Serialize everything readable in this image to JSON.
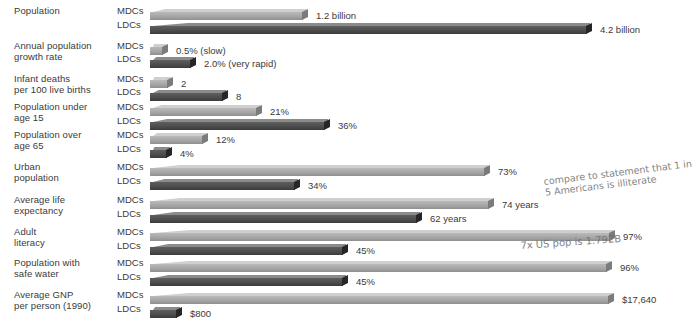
{
  "chart_data": {
    "type": "bar",
    "title": "",
    "xlabel": "",
    "ylabel": "",
    "orientation": "horizontal",
    "grid": false,
    "legend_position": "inline-row-labels",
    "series": [
      {
        "name": "MDCs",
        "style": "light"
      },
      {
        "name": "LDCs",
        "style": "dark"
      }
    ],
    "categories": [
      "Population",
      "Annual population growth rate",
      "Infant deaths per 100 live births",
      "Population under age 15",
      "Population over age 65",
      "Urban population",
      "Average life expectancy",
      "Adult literacy",
      "Population with safe water",
      "Average GNP per person (1990)"
    ],
    "rows": [
      {
        "label_line1": "Population",
        "label_line2": "",
        "mdc": {
          "group": "MDCs",
          "value": 1.2,
          "unit": "billion",
          "value_label": "1.2 billion",
          "bar_end_px": 308
        },
        "ldc": {
          "group": "LDCs",
          "value": 4.2,
          "unit": "billion",
          "value_label": "4.2 billion",
          "bar_end_px": 592
        }
      },
      {
        "label_line1": "Annual population",
        "label_line2": "growth rate",
        "mdc": {
          "group": "MDCs",
          "value": 0.5,
          "unit": "%",
          "value_label": "0.5% (slow)",
          "bar_end_px": 168
        },
        "ldc": {
          "group": "LDCs",
          "value": 2.0,
          "unit": "%",
          "value_label": "2.0% (very rapid)",
          "bar_end_px": 196
        }
      },
      {
        "label_line1": "Infant deaths",
        "label_line2": "per 100 live births",
        "mdc": {
          "group": "MDCs",
          "value": 2,
          "unit": "",
          "value_label": "2",
          "bar_end_px": 173
        },
        "ldc": {
          "group": "LDCs",
          "value": 8,
          "unit": "",
          "value_label": "8",
          "bar_end_px": 228
        }
      },
      {
        "label_line1": "Population under",
        "label_line2": "age 15",
        "mdc": {
          "group": "MDCs",
          "value": 21,
          "unit": "%",
          "value_label": "21%",
          "bar_end_px": 262
        },
        "ldc": {
          "group": "LDCs",
          "value": 36,
          "unit": "%",
          "value_label": "36%",
          "bar_end_px": 330
        }
      },
      {
        "label_line1": "Population over",
        "label_line2": "age 65",
        "mdc": {
          "group": "MDCs",
          "value": 12,
          "unit": "%",
          "value_label": "12%",
          "bar_end_px": 208
        },
        "ldc": {
          "group": "LDCs",
          "value": 4,
          "unit": "%",
          "value_label": "4%",
          "bar_end_px": 172
        }
      },
      {
        "label_line1": "Urban",
        "label_line2": "population",
        "mdc": {
          "group": "MDCs",
          "value": 73,
          "unit": "%",
          "value_label": "73%",
          "bar_end_px": 490
        },
        "ldc": {
          "group": "LDCs",
          "value": 34,
          "unit": "%",
          "value_label": "34%",
          "bar_end_px": 300
        }
      },
      {
        "label_line1": "Average life",
        "label_line2": "expectancy",
        "mdc": {
          "group": "MDCs",
          "value": 74,
          "unit": "years",
          "value_label": "74 years",
          "bar_end_px": 494
        },
        "ldc": {
          "group": "LDCs",
          "value": 62,
          "unit": "years",
          "value_label": "62 years",
          "bar_end_px": 422
        }
      },
      {
        "label_line1": "Adult",
        "label_line2": "literacy",
        "mdc": {
          "group": "MDCs",
          "value": 97,
          "unit": "%",
          "value_label": "97%",
          "bar_end_px": 615
        },
        "ldc": {
          "group": "LDCs",
          "value": 45,
          "unit": "%",
          "value_label": "45%",
          "bar_end_px": 348
        }
      },
      {
        "label_line1": "Population with",
        "label_line2": "safe water",
        "mdc": {
          "group": "MDCs",
          "value": 96,
          "unit": "%",
          "value_label": "96%",
          "bar_end_px": 612
        },
        "ldc": {
          "group": "LDCs",
          "value": 45,
          "unit": "%",
          "value_label": "45%",
          "bar_end_px": 348
        }
      },
      {
        "label_line1": "Average GNP",
        "label_line2": "per person (1990)",
        "mdc": {
          "group": "MDCs",
          "value": 17640,
          "unit": "$",
          "value_label": "$17,640",
          "bar_end_px": 614
        },
        "ldc": {
          "group": "LDCs",
          "value": 800,
          "unit": "$",
          "value_label": "$800",
          "bar_end_px": 182
        }
      }
    ],
    "colors": {
      "mdc_bar": "#a6a6a6",
      "ldc_bar": "#4d4d4d",
      "text": "#3a3a3a",
      "background": "#ffffff",
      "annotation": "#6f6f6f"
    }
  },
  "annotations": {
    "note_1": "compare to statement that 1 in 5 Americans is illiterate",
    "note_2": "7x US pop is 1.792B"
  }
}
